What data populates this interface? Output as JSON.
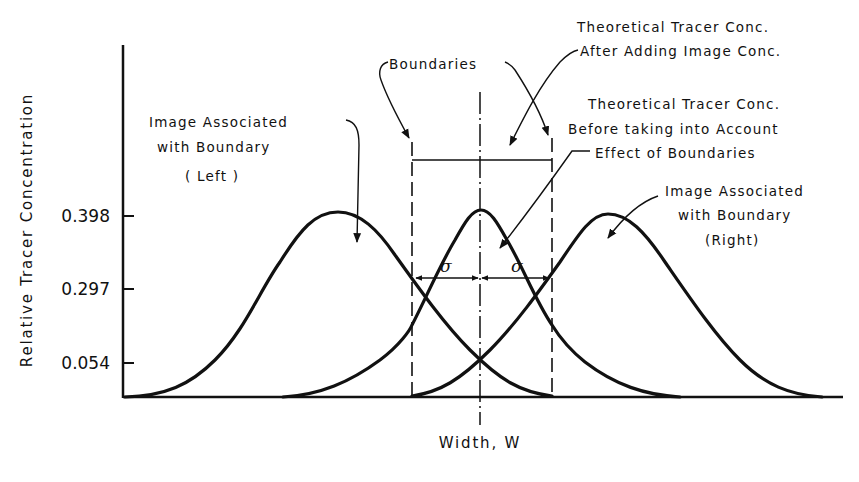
{
  "figure": {
    "y_axis_label": "Relative Tracer Concentration",
    "x_axis_label": "Width, W",
    "y_ticks": [
      {
        "label": "0.398",
        "value": 0.398
      },
      {
        "label": "0.297",
        "value": 0.297
      },
      {
        "label": "0.054",
        "value": 0.054
      }
    ],
    "sigma_symbol": "σ",
    "annotations": {
      "boundaries": "Boundaries",
      "after_adding": {
        "line1": "Theoretical Tracer Conc.",
        "line2": "After Adding Image Conc."
      },
      "before_taking": {
        "line1": "Theoretical Tracer Conc.",
        "line2": "Before taking into Account",
        "line3": "Effect of Boundaries"
      },
      "image_left": {
        "line1": "Image Associated",
        "line2": "with Boundary",
        "line3": "( Left )"
      },
      "image_right": {
        "line1": "Image Associated",
        "line2": "with Boundary",
        "line3": "(Right)"
      }
    },
    "curves": [
      {
        "name": "Image Associated with Boundary (Left)",
        "peak_x": 338,
        "peak": 0.398
      },
      {
        "name": "Theoretical Tracer Conc. (center)",
        "peak_x": 481,
        "peak": 0.398
      },
      {
        "name": "Image Associated with Boundary (Right)",
        "peak_x": 608,
        "peak": 0.398
      }
    ],
    "line_color": "#111111",
    "background": "#ffffff"
  }
}
